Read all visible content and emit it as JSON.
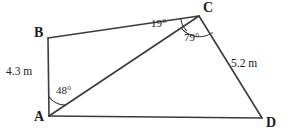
{
  "figure": {
    "type": "geometry-diagram",
    "shape": "quadrilateral-with-diagonal",
    "background_color": "#ffffff",
    "stroke_color": "#3a3a42",
    "text_color": "#1c1c1c",
    "vertices": [
      {
        "name": "A",
        "label": "A",
        "x": 49,
        "y": 116,
        "label_x": 34,
        "label_y": 112
      },
      {
        "name": "B",
        "label": "B",
        "x": 48,
        "y": 38,
        "label_x": 32,
        "label_y": 26
      },
      {
        "name": "C",
        "label": "C",
        "x": 199,
        "y": 16,
        "label_x": 203,
        "label_y": 1
      },
      {
        "name": "D",
        "label": "D",
        "x": 262,
        "y": 118,
        "label_x": 266,
        "label_y": 117
      }
    ],
    "edges": [
      {
        "name": "edge-ab",
        "from": "A",
        "to": "B"
      },
      {
        "name": "edge-bc",
        "from": "B",
        "to": "C"
      },
      {
        "name": "edge-cd",
        "from": "C",
        "to": "D"
      },
      {
        "name": "edge-ad",
        "from": "A",
        "to": "D"
      },
      {
        "name": "diagonal-ac",
        "from": "A",
        "to": "C"
      }
    ],
    "angles": [
      {
        "name": "angle-a-bac",
        "vertex": "A",
        "label": "48°",
        "value": 48,
        "unit": "degrees",
        "label_x": 56,
        "label_y": 85
      },
      {
        "name": "angle-c-bca",
        "vertex": "C",
        "label": "19°",
        "value": 19,
        "unit": "degrees",
        "label_x": 151,
        "label_y": 18
      },
      {
        "name": "angle-c-acd",
        "vertex": "C",
        "label": "79°",
        "value": 79,
        "unit": "degrees",
        "label_x": 184,
        "label_y": 32
      }
    ],
    "lengths": [
      {
        "name": "length-ab",
        "edge": "edge-ab",
        "label": "4.3 m",
        "value": 4.3,
        "unit": "m",
        "label_x": 6,
        "label_y": 66
      },
      {
        "name": "length-cd",
        "edge": "edge-cd",
        "label": "5.2 m",
        "value": 5.2,
        "unit": "m",
        "label_x": 231,
        "label_y": 58
      }
    ]
  }
}
